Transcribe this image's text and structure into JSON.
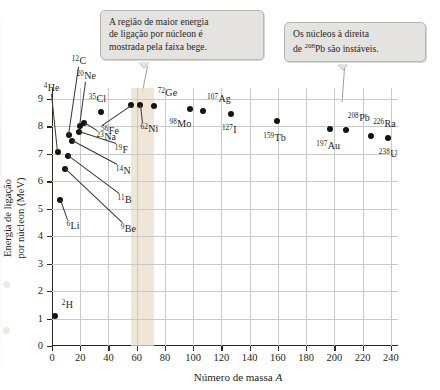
{
  "chart_data": {
    "type": "scatter",
    "title": "",
    "xlabel": "Número de massa A",
    "ylabel": "Energia de ligação por núcleon (MeV)",
    "xlim": [
      0,
      245
    ],
    "ylim": [
      0,
      9.4
    ],
    "xticks": [
      0,
      20,
      40,
      60,
      80,
      100,
      120,
      140,
      160,
      180,
      200,
      220,
      240
    ],
    "yticks": [
      0,
      1,
      2,
      3,
      4,
      5,
      6,
      7,
      8,
      9
    ],
    "grid": true,
    "legend": "none",
    "highlight_band": {
      "label": "faixa bege",
      "x_start": 56,
      "x_end": 72,
      "color": "#e8dfcb"
    },
    "points": [
      {
        "label": "2H",
        "mass": 2,
        "sup": "2",
        "sym": "H",
        "value": 1.11
      },
      {
        "label": "6Li",
        "mass": 6,
        "sup": "6",
        "sym": "Li",
        "value": 5.33
      },
      {
        "label": "9Be",
        "mass": 9,
        "sup": "9",
        "sym": "Be",
        "value": 6.46
      },
      {
        "label": "4He",
        "mass": 4,
        "sup": "4",
        "sym": "He",
        "value": 7.07
      },
      {
        "label": "11B",
        "mass": 11,
        "sup": "11",
        "sym": "B",
        "value": 6.93
      },
      {
        "label": "14N",
        "mass": 14,
        "sup": "14",
        "sym": "N",
        "value": 7.48
      },
      {
        "label": "19F",
        "mass": 19,
        "sup": "19",
        "sym": "F",
        "value": 7.78
      },
      {
        "label": "12C",
        "mass": 12,
        "sup": "12",
        "sym": "C",
        "value": 7.68
      },
      {
        "label": "23Na",
        "mass": 23,
        "sup": "23",
        "sym": "Na",
        "value": 8.11
      },
      {
        "label": "20Ne",
        "mass": 20,
        "sup": "20",
        "sym": "Ne",
        "value": 8.03
      },
      {
        "label": "35Cl",
        "mass": 35,
        "sup": "35",
        "sym": "Cl",
        "value": 8.52
      },
      {
        "label": "56Fe",
        "mass": 56,
        "sup": "56",
        "sym": "Fe",
        "value": 8.79
      },
      {
        "label": "62Ni",
        "mass": 62,
        "sup": "62",
        "sym": "Ni",
        "value": 8.79
      },
      {
        "label": "72Ge",
        "mass": 72,
        "sup": "72",
        "sym": "Ge",
        "value": 8.73
      },
      {
        "label": "98Mo",
        "mass": 98,
        "sup": "98",
        "sym": "Mo",
        "value": 8.64
      },
      {
        "label": "107Ag",
        "mass": 107,
        "sup": "107",
        "sym": "Ag",
        "value": 8.55
      },
      {
        "label": "127I",
        "mass": 127,
        "sup": "127",
        "sym": "I",
        "value": 8.45
      },
      {
        "label": "159Tb",
        "mass": 159,
        "sup": "159",
        "sym": "Tb",
        "value": 8.2
      },
      {
        "label": "197Au",
        "mass": 197,
        "sup": "197",
        "sym": "Au",
        "value": 7.92
      },
      {
        "label": "208Pb",
        "mass": 208,
        "sup": "208",
        "sym": "Pb",
        "value": 7.87
      },
      {
        "label": "226Ra",
        "mass": 226,
        "sup": "226",
        "sym": "Ra",
        "value": 7.66
      },
      {
        "label": "238U",
        "mass": 238,
        "sup": "238",
        "sym": "U",
        "value": 7.57
      }
    ],
    "annotations": [
      {
        "id": "band-note",
        "text_line1": "A região de maior energia",
        "text_line2": "de ligação por núcleon é",
        "text_line3": "mostrada pela faixa bege.",
        "points_to": "72Ge"
      },
      {
        "id": "instability-note",
        "text_pre": "Os núcleos à direita",
        "text_line2_pre": "de ",
        "text_line2_sup": "208",
        "text_line2_post": "Pb são instáveis.",
        "points_to": "208Pb"
      }
    ]
  }
}
